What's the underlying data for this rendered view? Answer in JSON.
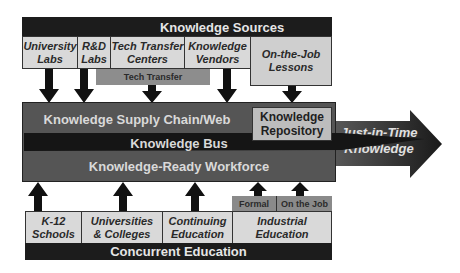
{
  "diagram": {
    "title": "Knowledge Sources",
    "sources": [
      {
        "id": "university-labs",
        "line1": "University",
        "line2": "Labs"
      },
      {
        "id": "rd-labs",
        "line1": "R&D",
        "line2": "Labs"
      },
      {
        "id": "tech-transfer-centers",
        "line1": "Tech Transfer",
        "line2": "Centers"
      },
      {
        "id": "knowledge-vendors",
        "line1": "Knowledge",
        "line2": "Vendors"
      },
      {
        "id": "on-the-job-lessons",
        "line1": "On-the-Job",
        "line2": "Lessons"
      }
    ],
    "tech_transfer_label": "Tech Transfer",
    "main": {
      "supply_chain": "Knowledge Supply Chain/Web",
      "bus": "Knowledge Bus",
      "workforce": "Knowledge-Ready Workforce",
      "repository_line1": "Knowledge",
      "repository_line2": "Repository"
    },
    "output_arrow": {
      "line1": "Just-in-Time",
      "line2": "Knowledge"
    },
    "education": [
      {
        "id": "k12",
        "line1": "K-12",
        "line2": "Schools"
      },
      {
        "id": "universities",
        "line1": "Universities",
        "line2": "& Colleges"
      },
      {
        "id": "continuing",
        "line1": "Continuing",
        "line2": "Education"
      },
      {
        "id": "industrial",
        "line1": "Industrial",
        "line2": "Education"
      }
    ],
    "industrial_sub": {
      "formal": "Formal",
      "on_the_job": "On the Job"
    },
    "bottom_title": "Concurrent Education",
    "colors": {
      "black_bar": "#1c1c1c",
      "light_box": "#d9d9d9",
      "mid_gray": "#8d8d8d",
      "main_block": "#555555",
      "bus": "#151515",
      "repository": "#bdbdbd"
    }
  }
}
